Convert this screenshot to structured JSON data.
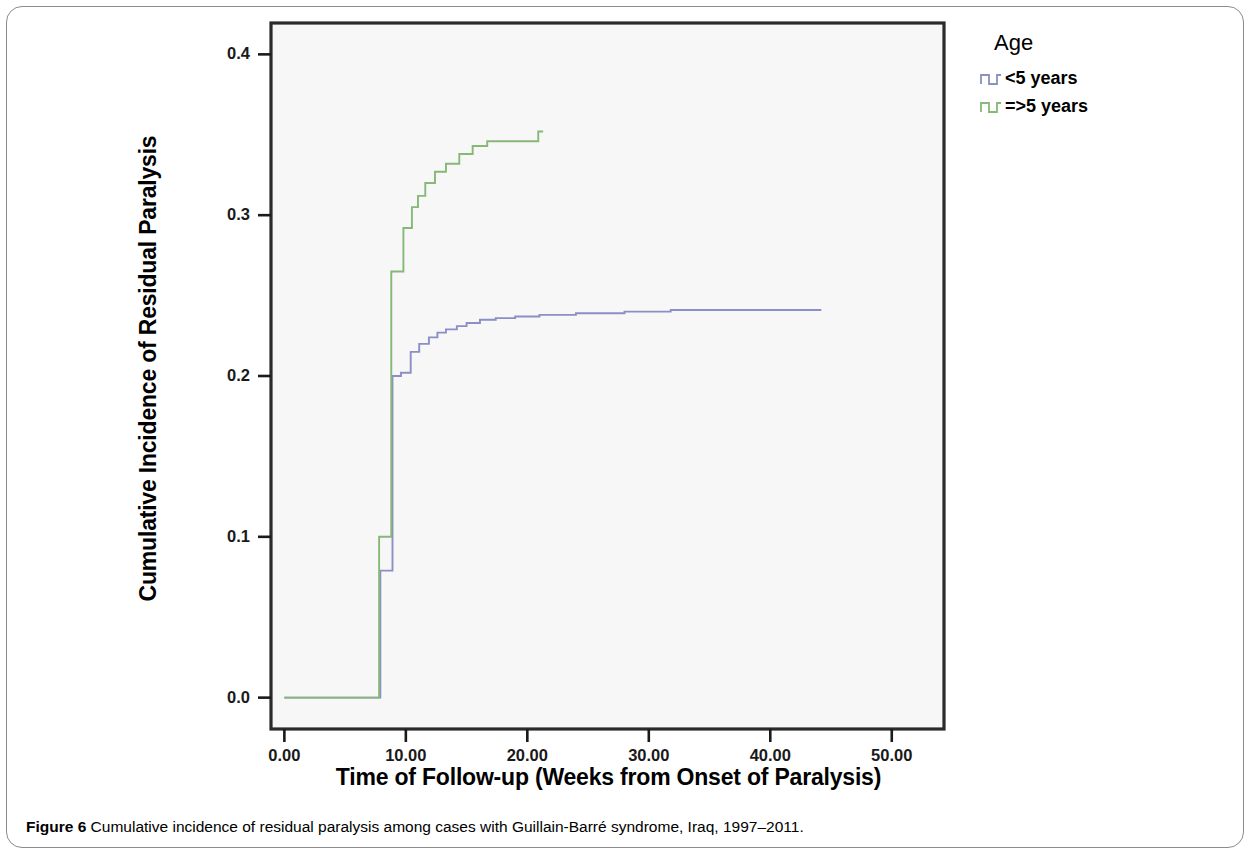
{
  "figure": {
    "caption_label": "Figure 6",
    "caption_text": "Cumulative incidence of residual paralysis among cases with Guillain-Barré syndrome, Iraq, 1997–2011."
  },
  "legend": {
    "title": "Age",
    "entries": [
      {
        "label": "<5 years",
        "color": "#8a8fc4"
      },
      {
        "label": "=>5 years",
        "color": "#86b877"
      }
    ]
  },
  "chart_data": {
    "type": "line",
    "subtype": "kaplan-meier-step",
    "title": "",
    "xlabel": "Time of Follow-up (Weeks from Onset of Paralysis)",
    "ylabel": "Cumulative Incidence of Residual Paralysis",
    "xlim": [
      -1.1,
      54.3
    ],
    "ylim": [
      -0.0195,
      0.4195
    ],
    "xticks": [
      0,
      10,
      20,
      30,
      40,
      50
    ],
    "xtick_labels": [
      "0.00",
      "10.00",
      "20.00",
      "30.00",
      "40.00",
      "50.00"
    ],
    "yticks": [
      0.0,
      0.1,
      0.2,
      0.3,
      0.4
    ],
    "ytick_labels": [
      "0.0",
      "0.1",
      "0.2",
      "0.3",
      "0.4"
    ],
    "grid": false,
    "legend_position": "right-top",
    "plot_background": "#f7f7f8",
    "series": [
      {
        "name": "<5 years",
        "color": "#8a8fc4",
        "points": [
          [
            0.0,
            0.0
          ],
          [
            7.9,
            0.0
          ],
          [
            7.9,
            0.079
          ],
          [
            8.9,
            0.079
          ],
          [
            8.9,
            0.2
          ],
          [
            9.6,
            0.2
          ],
          [
            9.6,
            0.202
          ],
          [
            10.4,
            0.202
          ],
          [
            10.4,
            0.215
          ],
          [
            11.1,
            0.215
          ],
          [
            11.1,
            0.22
          ],
          [
            11.9,
            0.22
          ],
          [
            11.9,
            0.224
          ],
          [
            12.6,
            0.224
          ],
          [
            12.6,
            0.227
          ],
          [
            13.3,
            0.227
          ],
          [
            13.3,
            0.229
          ],
          [
            14.2,
            0.229
          ],
          [
            14.2,
            0.231
          ],
          [
            15.0,
            0.231
          ],
          [
            15.0,
            0.233
          ],
          [
            16.1,
            0.233
          ],
          [
            16.1,
            0.235
          ],
          [
            17.4,
            0.235
          ],
          [
            17.4,
            0.236
          ],
          [
            19.0,
            0.236
          ],
          [
            19.0,
            0.237
          ],
          [
            21.0,
            0.237
          ],
          [
            21.0,
            0.238
          ],
          [
            24.0,
            0.238
          ],
          [
            24.0,
            0.239
          ],
          [
            28.0,
            0.239
          ],
          [
            28.0,
            0.24
          ],
          [
            31.8,
            0.24
          ],
          [
            31.8,
            0.241
          ],
          [
            44.2,
            0.241
          ]
        ]
      },
      {
        "name": "=>5 years",
        "color": "#86b877",
        "points": [
          [
            0.0,
            0.0
          ],
          [
            7.8,
            0.0
          ],
          [
            7.8,
            0.1
          ],
          [
            8.8,
            0.1
          ],
          [
            8.8,
            0.265
          ],
          [
            9.8,
            0.265
          ],
          [
            9.8,
            0.292
          ],
          [
            10.5,
            0.292
          ],
          [
            10.5,
            0.305
          ],
          [
            11.0,
            0.305
          ],
          [
            11.0,
            0.312
          ],
          [
            11.6,
            0.312
          ],
          [
            11.6,
            0.32
          ],
          [
            12.4,
            0.32
          ],
          [
            12.4,
            0.327
          ],
          [
            13.3,
            0.327
          ],
          [
            13.3,
            0.332
          ],
          [
            14.4,
            0.332
          ],
          [
            14.4,
            0.338
          ],
          [
            15.5,
            0.338
          ],
          [
            15.5,
            0.343
          ],
          [
            16.7,
            0.343
          ],
          [
            16.7,
            0.346
          ],
          [
            20.9,
            0.346
          ],
          [
            20.9,
            0.352
          ],
          [
            21.3,
            0.352
          ]
        ]
      }
    ]
  }
}
